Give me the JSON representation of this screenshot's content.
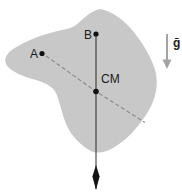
{
  "figure": {
    "type": "physics-free-body-diagram",
    "background": "#ffffff",
    "body_fill": "#c8c8c8",
    "points": {
      "a": {
        "label": "A"
      },
      "b": {
        "label": "B"
      },
      "cm": {
        "label": "CM"
      }
    },
    "gravity": {
      "label": "ḡ"
    },
    "colors": {
      "plumb_line": "#2b2b2b",
      "dashed_line": "#8c8c8c",
      "gravity_arrow": "#a3a3a3",
      "point_dot": "#111111",
      "label_text": "#1a1a1a"
    }
  }
}
